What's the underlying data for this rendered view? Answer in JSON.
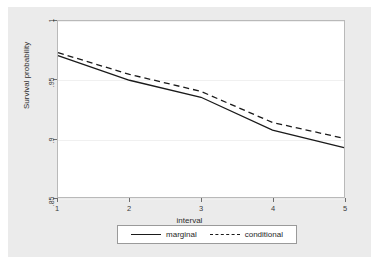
{
  "chart_data": {
    "type": "line",
    "title": "",
    "xlabel": "interval",
    "ylabel": "Survival probability",
    "x": [
      1,
      2,
      3,
      4,
      5
    ],
    "xlim": [
      1,
      5
    ],
    "ylim": [
      0.85,
      1.0
    ],
    "xticks": [
      "1",
      "2",
      "3",
      "4",
      "5"
    ],
    "yticks": [
      "1",
      ".95",
      ".9",
      ".85"
    ],
    "ytick_values": [
      1,
      0.95,
      0.9,
      0.85
    ],
    "grid": true,
    "legend_position": "bottom-center",
    "series": [
      {
        "name": "marginal",
        "style": "solid",
        "color": "#1a1a1a",
        "values": [
          0.9705,
          0.9495,
          0.935,
          0.907,
          0.892
        ]
      },
      {
        "name": "conditional",
        "style": "dashed",
        "color": "#1a1a1a",
        "values": [
          0.973,
          0.9545,
          0.94,
          0.9135,
          0.9
        ]
      }
    ]
  },
  "legend": {
    "entries": [
      {
        "label": "marginal",
        "style": "solid"
      },
      {
        "label": "conditional",
        "style": "dashed"
      }
    ]
  },
  "colors": {
    "figure_background": "#ebebeb",
    "plot_background": "#ffffff",
    "axis": "#6e6e6e",
    "gridline": "#f0f0f0",
    "series": "#1a1a1a"
  }
}
